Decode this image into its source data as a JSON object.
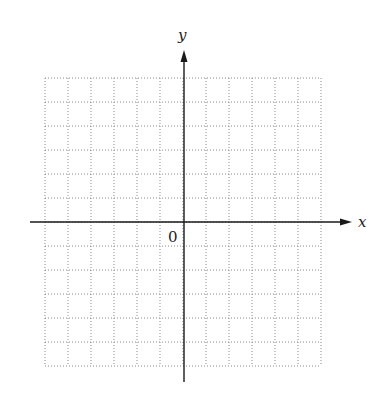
{
  "diagram": {
    "type": "coordinate-grid",
    "x_axis_label": "x",
    "y_axis_label": "y",
    "origin_label": "0",
    "grid": {
      "columns": 12,
      "rows": 12,
      "left": 45,
      "right": 321,
      "top": 78,
      "bottom": 366,
      "line_style": "dotted",
      "line_color": "#8a8a8a"
    },
    "axes": {
      "color": "#1a1a1a",
      "origin_x": 184,
      "origin_y": 222,
      "x_start": 30,
      "x_end": 352,
      "y_start": 382,
      "y_end": 50
    }
  }
}
